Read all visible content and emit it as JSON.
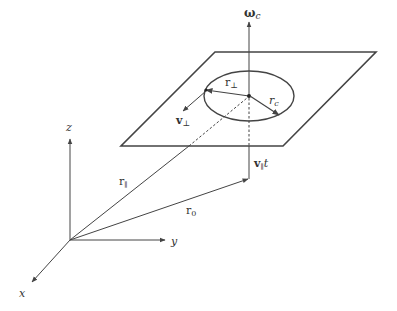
{
  "diagram": {
    "colors": {
      "line": "#444444",
      "text": "#333333",
      "background": "#ffffff"
    },
    "labels": {
      "omega": "ω",
      "omega_sub": "c",
      "r_perp": "r",
      "r_perp_sub": "⊥",
      "r_c": "r",
      "r_c_sub": "c",
      "v_perp": "v",
      "v_perp_sub": "⊥",
      "v_par_t": "v",
      "v_par_t_sub": "∥",
      "v_par_t_tail": "t",
      "r_par": "r",
      "r_par_sub": "∥",
      "r_0": "r",
      "r_0_sub": "0",
      "axis_x": "x",
      "axis_y": "y",
      "axis_z": "z"
    }
  }
}
